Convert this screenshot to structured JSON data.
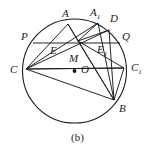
{
  "figure": {
    "caption": "(b)",
    "stroke_color": "#1a1a1a",
    "background_color": "#ffffff",
    "circle": {
      "cx": 74.5,
      "cy": 71,
      "r": 52
    },
    "center_marker": {
      "label": "O",
      "x": 74.5,
      "y": 71
    },
    "labels": [
      {
        "id": "A",
        "text": "A",
        "sub": "",
        "x": 62,
        "y": 8
      },
      {
        "id": "A1",
        "text": "A",
        "sub": "1",
        "x": 90,
        "y": 7
      },
      {
        "id": "D",
        "text": "D",
        "sub": "",
        "x": 110,
        "y": 13
      },
      {
        "id": "P",
        "text": "P",
        "sub": "",
        "x": 21,
        "y": 31
      },
      {
        "id": "Q",
        "text": "Q",
        "sub": "",
        "x": 122,
        "y": 31
      },
      {
        "id": "E",
        "text": "E",
        "sub": "",
        "x": 50,
        "y": 45
      },
      {
        "id": "E1",
        "text": "E",
        "sub": "1",
        "x": 97,
        "y": 44
      },
      {
        "id": "M",
        "text": "M",
        "sub": "",
        "x": 69,
        "y": 53
      },
      {
        "id": "O",
        "text": "O",
        "sub": "",
        "x": 81,
        "y": 64
      },
      {
        "id": "C",
        "text": "C",
        "sub": "",
        "x": 10,
        "y": 64
      },
      {
        "id": "C1",
        "text": "C",
        "sub": "1",
        "x": 131,
        "y": 62
      },
      {
        "id": "B",
        "text": "B",
        "sub": "",
        "x": 119,
        "y": 103
      }
    ],
    "points": {
      "A": {
        "x": 68,
        "y": 24
      },
      "A1": {
        "x": 98,
        "y": 23
      },
      "D": {
        "x": 109,
        "y": 30
      },
      "P": {
        "x": 33,
        "y": 43
      },
      "Q": {
        "x": 120,
        "y": 43
      },
      "E": {
        "x": 57,
        "y": 42
      },
      "E1": {
        "x": 99,
        "y": 42
      },
      "M": {
        "x": 78,
        "y": 41
      },
      "C": {
        "x": 26,
        "y": 69
      },
      "C1": {
        "x": 124,
        "y": 68
      },
      "B": {
        "x": 114,
        "y": 100
      },
      "O": {
        "x": 74.5,
        "y": 71
      }
    },
    "segments": [
      {
        "name": "chord-P-Q",
        "from": "P",
        "to": "Q"
      },
      {
        "name": "chord-C-C1",
        "from": "C",
        "to": "C1"
      },
      {
        "name": "chord-A-C",
        "from": "A",
        "to": "C"
      },
      {
        "name": "chord-A-B",
        "from": "A",
        "to": "B"
      },
      {
        "name": "chord-A-M",
        "from": "A",
        "to": "M"
      },
      {
        "name": "chord-A1-C",
        "from": "A1",
        "to": "C"
      },
      {
        "name": "chord-A1-M",
        "from": "A1",
        "to": "M"
      },
      {
        "name": "chord-A1-B",
        "from": "A1",
        "to": "B"
      },
      {
        "name": "chord-D-C",
        "from": "D",
        "to": "C"
      },
      {
        "name": "chord-D-M",
        "from": "D",
        "to": "M"
      },
      {
        "name": "chord-D-B",
        "from": "D",
        "to": "B"
      },
      {
        "name": "chord-C-C1b",
        "from": "C",
        "to": "C1"
      },
      {
        "name": "chord-M-C1",
        "from": "M",
        "to": "C1"
      },
      {
        "name": "chord-M-B",
        "from": "M",
        "to": "B"
      },
      {
        "name": "chord-C1-B",
        "from": "C1",
        "to": "B"
      },
      {
        "name": "chord-C-B",
        "from": "C",
        "to": "B"
      }
    ]
  }
}
